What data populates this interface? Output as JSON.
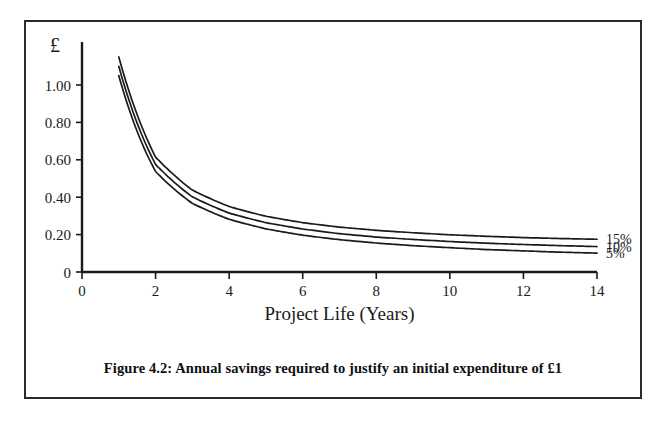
{
  "figure": {
    "caption": "Figure 4.2: Annual savings required to justify an initial expenditure of £1",
    "unit_symbol": "£"
  },
  "chart_data": {
    "type": "line",
    "title": "Annual savings required to justify an initial expenditure of £1",
    "xlabel": "Project Life (Years)",
    "ylabel": "£",
    "xlim": [
      0,
      14
    ],
    "ylim": [
      0,
      1.2
    ],
    "grid": false,
    "legend_position": "right-end-of-lines",
    "xticks": [
      0,
      2,
      4,
      6,
      8,
      10,
      12,
      14
    ],
    "xtick_labels": [
      "0",
      "2",
      "4",
      "6",
      "8",
      "10",
      "12",
      "14"
    ],
    "yticks": [
      0,
      0.2,
      0.4,
      0.6,
      0.8,
      1.0
    ],
    "ytick_labels": [
      "0",
      "0.20",
      "0.40",
      "0.60",
      "0.80",
      "1.00"
    ],
    "x": [
      1,
      2,
      3,
      4,
      5,
      6,
      7,
      8,
      9,
      10,
      11,
      12,
      13,
      14
    ],
    "series": [
      {
        "name": "15%",
        "label": "15%",
        "color": "#1a1a1a",
        "values": [
          1.15,
          0.615,
          0.438,
          0.35,
          0.298,
          0.264,
          0.24,
          0.223,
          0.21,
          0.199,
          0.191,
          0.184,
          0.179,
          0.175
        ]
      },
      {
        "name": "10%",
        "label": "10%",
        "color": "#1a1a1a",
        "values": [
          1.1,
          0.576,
          0.402,
          0.315,
          0.264,
          0.23,
          0.205,
          0.187,
          0.174,
          0.163,
          0.154,
          0.147,
          0.141,
          0.136
        ]
      },
      {
        "name": "5%",
        "label": "5%",
        "color": "#1a1a1a",
        "values": [
          1.05,
          0.538,
          0.367,
          0.282,
          0.231,
          0.197,
          0.173,
          0.155,
          0.141,
          0.13,
          0.12,
          0.113,
          0.106,
          0.101
        ]
      }
    ]
  }
}
